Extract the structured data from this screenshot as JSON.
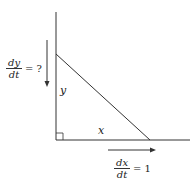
{
  "diagram": {
    "type": "related-rates-right-triangle",
    "labels": {
      "vertical_side": "y",
      "horizontal_side": "x"
    },
    "rates": {
      "dy_dt": {
        "numerator": "dy",
        "denominator": "dt",
        "rhs": "= ?"
      },
      "dx_dt": {
        "numerator": "dx",
        "denominator": "dt",
        "rhs": "= 1"
      }
    },
    "colors": {
      "line": "#333333",
      "text": "#222222"
    }
  }
}
